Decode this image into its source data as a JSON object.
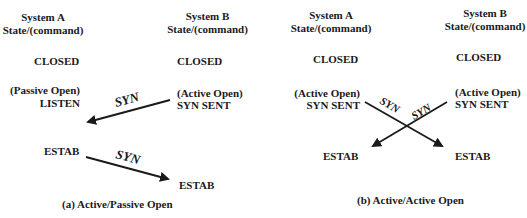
{
  "panel_a": {
    "caption": "(a) Active/Passive Open",
    "system_a": {
      "header_1": "System A",
      "header_2": "State/(command)",
      "state_closed": "CLOSED",
      "command": "(Passive Open)",
      "state_listen": "LISTEN",
      "state_estab": "ESTAB"
    },
    "system_b": {
      "header_1": "System B",
      "header_2": "State/(command)",
      "state_closed": "CLOSED",
      "command": "(Active Open)",
      "state_syn_sent": "SYN SENT",
      "state_estab": "ESTAB"
    },
    "arrows": [
      {
        "label": "SYN",
        "from": "System B",
        "to": "System A"
      },
      {
        "label": "SYN",
        "from": "System A",
        "to": "System B"
      }
    ]
  },
  "panel_b": {
    "caption": "(b) Active/Active Open",
    "system_a": {
      "header_1": "System A",
      "header_2": "State/(command)",
      "state_closed": "CLOSED",
      "command": "(Active Open)",
      "state_syn_sent": "SYN SENT",
      "state_estab": "ESTAB"
    },
    "system_b": {
      "header_1": "System B",
      "header_2": "State/(command)",
      "state_closed": "CLOSED",
      "command": "(Active Open)",
      "state_syn_sent": "SYN SENT",
      "state_estab": "ESTAB"
    },
    "arrows": [
      {
        "label": "SYN",
        "from": "System A",
        "to": "System B"
      },
      {
        "label": "SYN",
        "from": "System B",
        "to": "System A"
      }
    ]
  }
}
